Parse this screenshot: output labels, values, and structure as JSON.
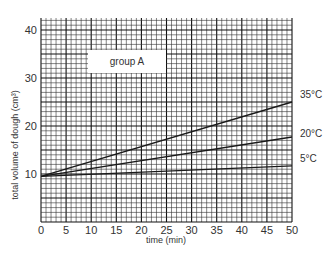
{
  "chart_data": {
    "type": "line",
    "title": "",
    "annotation": "group A",
    "xlabel": "time (min)",
    "ylabel": "total volume of dough (cm³)",
    "xlim": [
      0,
      50
    ],
    "ylim": [
      0,
      42.5
    ],
    "x_ticks": [
      0,
      5,
      10,
      15,
      20,
      25,
      30,
      35,
      40,
      45,
      50
    ],
    "y_ticks": [
      10,
      20,
      30,
      40
    ],
    "grid": true,
    "grid_minor_step": {
      "x": 1,
      "y": 1
    },
    "grid_major_step": {
      "x": 5,
      "y": 5
    },
    "legend_position": "right-end-labels",
    "x": [
      0,
      50
    ],
    "series": [
      {
        "name": "35°C",
        "values": [
          9.5,
          25
        ]
      },
      {
        "name": "20°C",
        "values": [
          9.5,
          17.7
        ]
      },
      {
        "name": "5°C",
        "values": [
          9.5,
          11.7
        ]
      }
    ]
  },
  "colors": {
    "line": "#1a1a1a",
    "grid_minor": "#333333",
    "grid_major": "#111111",
    "background": "#ffffff"
  }
}
